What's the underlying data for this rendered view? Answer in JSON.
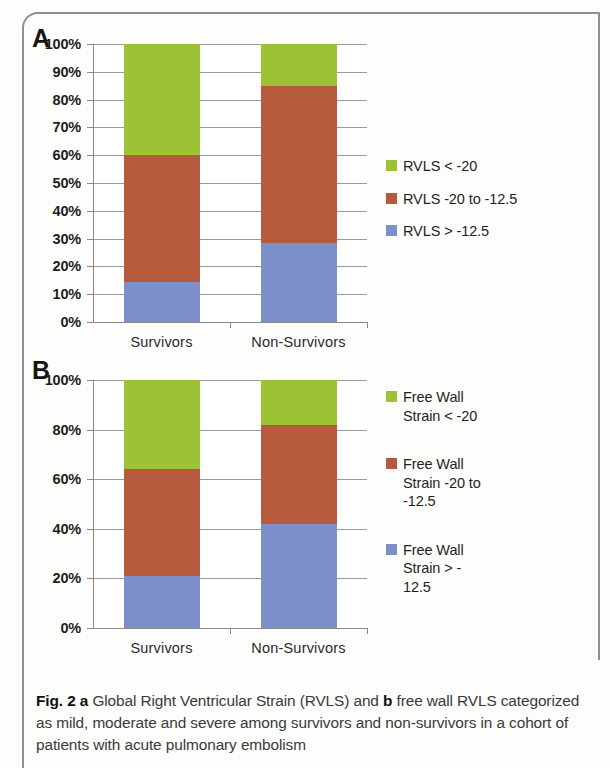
{
  "figure": {
    "caption_prefix": "Fig. 2",
    "caption_a_marker": "a",
    "caption_part1": " Global Right Ventricular Strain (RVLS) and ",
    "caption_b_marker": "b",
    "caption_part2": " free wall RVLS categorized as mild, moderate and severe among survivors and non-survivors in a cohort of patients with acute pulmonary embolism"
  },
  "colors": {
    "green": "#9CC335",
    "red": "#B55A3C",
    "blue": "#7C8FC8",
    "gridline": "#9a9a9a",
    "axis": "#8a8a8a",
    "frame": "#8f9095"
  },
  "panel_a": {
    "letter": "A",
    "legend": [
      {
        "label": "RVLS < -20",
        "color": "#9CC335"
      },
      {
        "label": "RVLS -20 to -12.5",
        "color": "#B55A3C"
      },
      {
        "label": "RVLS > -12.5",
        "color": "#7C8FC8"
      }
    ],
    "y_ticks": [
      "100%",
      "90%",
      "80%",
      "70%",
      "60%",
      "50%",
      "40%",
      "30%",
      "20%",
      "10%",
      "0%"
    ],
    "x_labels": [
      "Survivors",
      "Non-Survivors"
    ]
  },
  "panel_b": {
    "letter": "B",
    "legend": [
      {
        "label": "Free Wall\nStrain < -20",
        "color": "#9CC335"
      },
      {
        "label": "Free Wall\nStrain -20 to\n-12.5",
        "color": "#B55A3C"
      },
      {
        "label": "Free Wall\nStrain > -\n12.5",
        "color": "#7C8FC8"
      }
    ],
    "y_ticks": [
      "100%",
      "80%",
      "60%",
      "40%",
      "20%",
      "0%"
    ],
    "x_labels": [
      "Survivors",
      "Non-Survivors"
    ]
  },
  "chart_data": [
    {
      "type": "bar",
      "stacked": true,
      "panel": "A",
      "title": "Global Right Ventricular Strain (RVLS)",
      "xlabel": "",
      "ylabel": "",
      "categories": [
        "Survivors",
        "Non-Survivors"
      ],
      "ylim": [
        0,
        100
      ],
      "ytick_step": 10,
      "grid": true,
      "legend_position": "right",
      "series": [
        {
          "name": "RVLS > -12.5",
          "color": "#7C8FC8",
          "values": [
            14.5,
            28.5
          ]
        },
        {
          "name": "RVLS -20 to -12.5",
          "color": "#B55A3C",
          "values": [
            45.5,
            56.5
          ]
        },
        {
          "name": "RVLS < -20",
          "color": "#9CC335",
          "values": [
            40.0,
            15.0
          ]
        }
      ],
      "cumulative_boundaries": {
        "Survivors": [
          14.5,
          60.0,
          100.0
        ],
        "Non-Survivors": [
          28.5,
          85.0,
          100.0
        ]
      }
    },
    {
      "type": "bar",
      "stacked": true,
      "panel": "B",
      "title": "Free wall RVLS",
      "xlabel": "",
      "ylabel": "",
      "categories": [
        "Survivors",
        "Non-Survivors"
      ],
      "ylim": [
        0,
        100
      ],
      "ytick_step": 20,
      "grid": true,
      "legend_position": "right",
      "series": [
        {
          "name": "Free Wall Strain > -12.5",
          "color": "#7C8FC8",
          "values": [
            21.0,
            42.0
          ]
        },
        {
          "name": "Free Wall Strain -20 to -12.5",
          "color": "#B55A3C",
          "values": [
            43.0,
            40.0
          ]
        },
        {
          "name": "Free Wall Strain < -20",
          "color": "#9CC335",
          "values": [
            36.0,
            18.0
          ]
        }
      ],
      "cumulative_boundaries": {
        "Survivors": [
          21.0,
          64.0,
          100.0
        ],
        "Non-Survivors": [
          42.0,
          82.0,
          100.0
        ]
      }
    }
  ]
}
